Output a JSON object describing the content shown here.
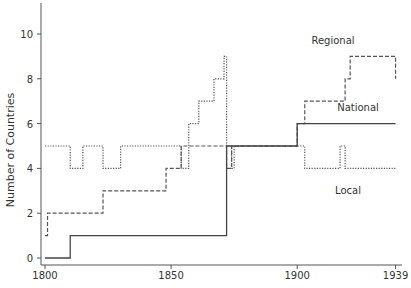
{
  "chart_data": {
    "type": "line",
    "step": true,
    "title": "",
    "xlabel": "",
    "ylabel": "Number of Countries",
    "xlim": [
      1800,
      1939
    ],
    "ylim": [
      0,
      11
    ],
    "x_ticks": [
      1800,
      1850,
      1900,
      1939
    ],
    "y_ticks": [
      0,
      2,
      4,
      6,
      8,
      10
    ],
    "grid": false,
    "legend": "inline labels",
    "series": [
      {
        "name": "Regional",
        "style": "dashed",
        "label_pos": [
          333,
          44
        ],
        "points": [
          [
            1800,
            1
          ],
          [
            1801,
            2
          ],
          [
            1823,
            3
          ],
          [
            1848,
            4
          ],
          [
            1854,
            5
          ],
          [
            1872,
            4
          ],
          [
            1874,
            5
          ],
          [
            1900,
            6
          ],
          [
            1903,
            7
          ],
          [
            1919,
            8
          ],
          [
            1921,
            9
          ],
          [
            1939,
            8
          ]
        ]
      },
      {
        "name": "National",
        "style": "solid",
        "label_pos": [
          358,
          111
        ],
        "points": [
          [
            1800,
            0
          ],
          [
            1810,
            1
          ],
          [
            1872,
            5
          ],
          [
            1900,
            6
          ],
          [
            1939,
            6
          ]
        ]
      },
      {
        "name": "Local",
        "style": "dotted",
        "label_pos": [
          348,
          194
        ],
        "points": [
          [
            1800,
            5
          ],
          [
            1810,
            4
          ],
          [
            1815,
            5
          ],
          [
            1823,
            4
          ],
          [
            1830,
            5
          ],
          [
            1854,
            4
          ],
          [
            1857,
            6
          ],
          [
            1861,
            7
          ],
          [
            1867,
            8
          ],
          [
            1871,
            9
          ],
          [
            1872,
            5
          ],
          [
            1874,
            4
          ],
          [
            1875,
            5
          ],
          [
            1903,
            4
          ],
          [
            1917,
            5
          ],
          [
            1919,
            4
          ],
          [
            1939,
            4
          ]
        ]
      }
    ]
  }
}
